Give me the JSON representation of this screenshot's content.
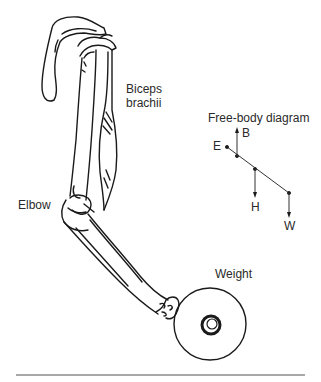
{
  "figure": {
    "labels": {
      "biceps_line1": "Biceps",
      "biceps_line2": "brachii",
      "elbow": "Elbow",
      "weight": "Weight"
    },
    "free_body_diagram": {
      "title": "Free-body diagram",
      "points": {
        "E": "E",
        "B": "B",
        "H": "H",
        "W": "W"
      }
    },
    "colors": {
      "ink": "#1a1a1a",
      "text": "#2a2a2a",
      "rule": "#a8a8a8"
    }
  }
}
